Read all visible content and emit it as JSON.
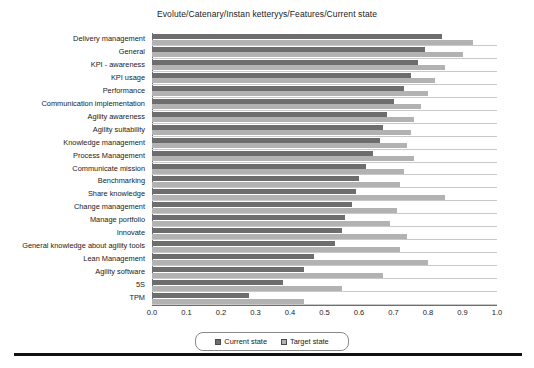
{
  "chart_data": {
    "type": "bar",
    "orientation": "horizontal",
    "title": "Evolute/Catenary/Instan ketteryys/Features/Current state",
    "xlabel": "",
    "ylabel": "",
    "xlim": [
      0.0,
      1.0
    ],
    "grid": true,
    "legend_position": "bottom-center",
    "xticks": [
      "0.0",
      "0.1",
      "0.2",
      "0.3",
      "0.4",
      "0.5",
      "0.6",
      "0.7",
      "0.8",
      "0.9",
      "1.0"
    ],
    "xtick_values": [
      0.0,
      0.1,
      0.2,
      0.3,
      0.4,
      0.5,
      0.6,
      0.7,
      0.8,
      0.9,
      1.0
    ],
    "categories": [
      "Delivery management",
      "General",
      "KPI - awareness",
      "KPI usage",
      "Performance",
      "Communication implementation",
      "Agility awareness",
      "Agility suitability",
      "Knowledge management",
      "Process Management",
      "Communicate mission",
      "Benchmarking",
      "Share knowledge",
      "Change management",
      "Manage portfolio",
      "Innovate",
      "General knowledge about agility tools",
      "Lean Management",
      "Agility software",
      "5S",
      "TPM"
    ],
    "series": [
      {
        "name": "Current state",
        "color": "#6d6d6d",
        "values": [
          0.84,
          0.79,
          0.77,
          0.75,
          0.73,
          0.7,
          0.68,
          0.67,
          0.66,
          0.64,
          0.62,
          0.6,
          0.59,
          0.58,
          0.56,
          0.55,
          0.53,
          0.47,
          0.44,
          0.38,
          0.28
        ]
      },
      {
        "name": "Target state",
        "color": "#b2b2b2",
        "values": [
          0.93,
          0.9,
          0.85,
          0.82,
          0.8,
          0.78,
          0.76,
          0.75,
          0.74,
          0.76,
          0.73,
          0.72,
          0.85,
          0.71,
          0.69,
          0.74,
          0.72,
          0.8,
          0.67,
          0.55,
          0.44
        ]
      }
    ]
  },
  "legend": {
    "items": [
      {
        "label": "Current state",
        "color": "#6d6d6d"
      },
      {
        "label": "Target state",
        "color": "#b2b2b2"
      }
    ]
  }
}
